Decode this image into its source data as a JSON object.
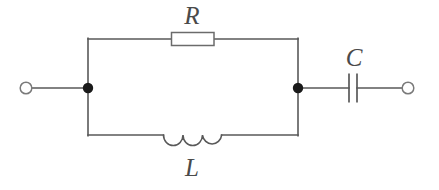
{
  "diagram": {
    "type": "electrical-circuit-schematic",
    "canvas": {
      "width": 439,
      "height": 190,
      "background": "#ffffff"
    },
    "style": {
      "wire_color": "#595959",
      "wire_width": 1.6,
      "component_outline_color": "#6b6b6b",
      "component_fill": "#ffffff",
      "node_fill": "#1a1a1a",
      "terminal_stroke": "#7a7a7a",
      "label_color": "#4a4a4a"
    },
    "labels": {
      "resistor": "R",
      "inductor": "L",
      "capacitor": "C"
    },
    "components": [
      {
        "name": "resistor",
        "label": "R",
        "symbol": "rectangle-box",
        "branch": "top",
        "x1": 171,
        "x2": 214,
        "y": 39,
        "box_height": 13
      },
      {
        "name": "inductor",
        "label": "L",
        "symbol": "coil-three-arcs",
        "branch": "bottom",
        "x1": 163,
        "x2": 222,
        "y": 135,
        "loops": 3
      },
      {
        "name": "capacitor",
        "label": "C",
        "symbol": "two-parallel-plates",
        "branch": "right-series",
        "plate1_x": 349,
        "plate2_x": 357,
        "y": 88,
        "plate_height": 29
      }
    ],
    "nodes": [
      {
        "name": "left-junction",
        "x": 88,
        "y": 88,
        "radius": 5,
        "filled": true
      },
      {
        "name": "right-junction",
        "x": 298,
        "y": 88,
        "radius": 5,
        "filled": true
      }
    ],
    "terminals": [
      {
        "name": "left-terminal",
        "x": 26,
        "y": 88,
        "radius": 6,
        "filled": false
      },
      {
        "name": "right-terminal",
        "x": 408,
        "y": 88,
        "radius": 6,
        "filled": false
      }
    ],
    "wires": {
      "left_lead": {
        "x1": 26,
        "x2": 88,
        "y": 88
      },
      "left_rail": {
        "x": 88,
        "y1": 39,
        "y2": 135
      },
      "right_rail": {
        "x": 298,
        "y1": 39,
        "y2": 135
      },
      "top_left_segment": {
        "x1": 88,
        "x2": 171,
        "y": 39
      },
      "top_right_segment": {
        "x1": 214,
        "x2": 298,
        "y": 39
      },
      "bottom_left_segment": {
        "x1": 88,
        "x2": 163,
        "y": 135
      },
      "bottom_right_segment": {
        "x1": 222,
        "x2": 298,
        "y": 135
      },
      "right_lead_inner": {
        "x1": 298,
        "x2": 349,
        "y": 88
      },
      "right_lead_outer": {
        "x1": 357,
        "x2": 402,
        "y": 88
      }
    }
  }
}
